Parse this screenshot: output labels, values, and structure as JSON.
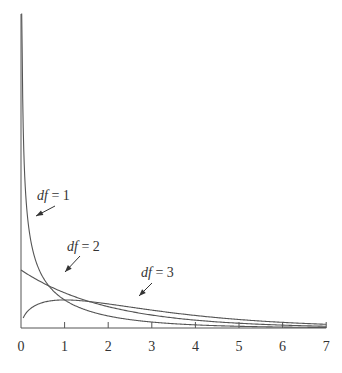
{
  "chart_data": {
    "type": "line",
    "title": "",
    "xlabel": "",
    "ylabel": "",
    "xlim": [
      0,
      7
    ],
    "x_ticks": [
      "0",
      "1",
      "2",
      "3",
      "4",
      "5",
      "6",
      "7"
    ],
    "grid": false,
    "legend": "inline annotations with arrows",
    "series": [
      {
        "name": "df = 1",
        "description": "chi-square density, df=1",
        "x": [
          0.02,
          0.1,
          0.25,
          0.5,
          1,
          1.5,
          2,
          3,
          4,
          5,
          6,
          7
        ],
        "values": [
          2.8,
          1.2,
          0.7,
          0.44,
          0.24,
          0.15,
          0.1,
          0.05,
          0.027,
          0.015,
          0.008,
          0.005
        ]
      },
      {
        "name": "df = 2",
        "description": "chi-square density, df=2",
        "x": [
          0,
          0.5,
          1,
          1.5,
          2,
          3,
          4,
          5,
          6,
          7
        ],
        "values": [
          0.5,
          0.39,
          0.3,
          0.24,
          0.18,
          0.11,
          0.068,
          0.041,
          0.025,
          0.015
        ]
      },
      {
        "name": "df = 3",
        "description": "chi-square density, df=3",
        "x": [
          0.05,
          0.25,
          0.5,
          1,
          1.5,
          2,
          3,
          4,
          5,
          6,
          7
        ],
        "values": [
          0.09,
          0.2,
          0.22,
          0.24,
          0.23,
          0.21,
          0.15,
          0.11,
          0.07,
          0.046,
          0.03
        ]
      }
    ],
    "annotations": [
      {
        "text": "df = 1",
        "points_to_x": 0.35
      },
      {
        "text": "df = 2",
        "points_to_x": 1.0
      },
      {
        "text": "df = 3",
        "points_to_x": 3.0
      }
    ]
  },
  "labels": {
    "df1": "df = 1",
    "df2": "df = 2",
    "df3": "df = 3"
  },
  "ticks": [
    "0",
    "1",
    "2",
    "3",
    "4",
    "5",
    "6",
    "7"
  ]
}
